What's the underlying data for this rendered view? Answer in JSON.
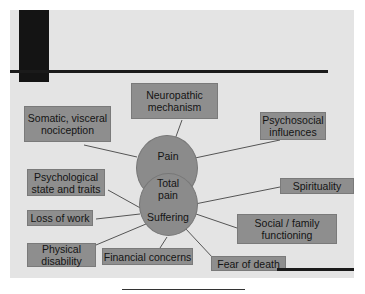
{
  "diagram": {
    "title": "Total pain",
    "center": {
      "upper_circle_label": "Pain",
      "overlap_label": "Total\npain",
      "lower_circle_label": "Suffering"
    },
    "pain_factors": [
      {
        "id": "somatic",
        "label": "Somatic, visceral\nnociception"
      },
      {
        "id": "neuropathic",
        "label": "Neuropathic\nmechanism"
      },
      {
        "id": "psychosocial",
        "label": "Psychosocial\ninfluences"
      }
    ],
    "suffering_factors": [
      {
        "id": "psychological",
        "label": "Psychological\nstate and traits"
      },
      {
        "id": "spirituality",
        "label": "Spirituality"
      },
      {
        "id": "loss-of-work",
        "label": "Loss of work"
      },
      {
        "id": "social-family",
        "label": "Social / family\nfunctioning"
      },
      {
        "id": "physical-disability",
        "label": "Physical\ndisability"
      },
      {
        "id": "financial",
        "label": "Financial concerns"
      },
      {
        "id": "fear-of-death",
        "label": "Fear of death"
      }
    ],
    "colors": {
      "slide_background": "#e4e4e4",
      "box_fill": "#8e8e8e",
      "circle_fill": "#8b8b8b",
      "accent_dark": "#141414"
    }
  }
}
